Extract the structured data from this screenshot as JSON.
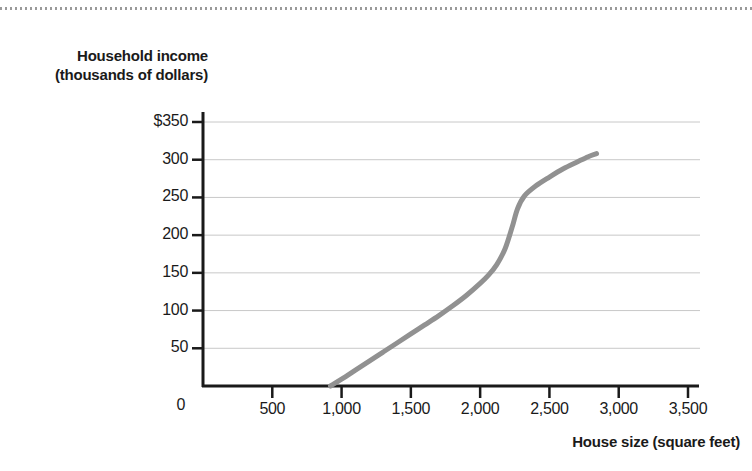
{
  "chart_data": {
    "type": "line",
    "title": "",
    "xlabel": "House size (square feet)",
    "ylabel": "Household income (thousands of dollars)",
    "xlim": [
      0,
      3500
    ],
    "ylim": [
      0,
      350
    ],
    "xticks": [
      0,
      500,
      1000,
      1500,
      2000,
      2500,
      3000,
      3500
    ],
    "xtick_labels": [
      "0",
      "500",
      "1,000",
      "1,500",
      "2,000",
      "2,500",
      "3,000",
      "3,500"
    ],
    "yticks": [
      0,
      50,
      100,
      150,
      200,
      250,
      300,
      350
    ],
    "ytick_labels": [
      "0",
      "50",
      "100",
      "150",
      "200",
      "250",
      "300",
      "$350"
    ],
    "grid": "horizontal",
    "legend": "none",
    "series": [
      {
        "name": "Household income vs house size",
        "color": "#919191",
        "linewidth": 5,
        "x": [
          920,
          1000,
          1100,
          1200,
          1300,
          1400,
          1500,
          1600,
          1700,
          1800,
          1900,
          2000,
          2060,
          2120,
          2180,
          2230,
          2270,
          2320,
          2400,
          2500,
          2600,
          2700,
          2780,
          2840
        ],
        "y": [
          0,
          9,
          21,
          33,
          45,
          57,
          69,
          81,
          93,
          106,
          120,
          136,
          147,
          161,
          182,
          210,
          235,
          252,
          265,
          277,
          288,
          297,
          304,
          308
        ]
      }
    ]
  },
  "axis": {
    "y_title_line1": "Household income",
    "y_title_line2": "(thousands of dollars)",
    "x_title": "House size (square feet)",
    "origin_label": "0"
  },
  "colors": {
    "curve": "#919191",
    "axis": "#1a1a1a",
    "grid": "#c8c8c8",
    "text": "#1a1a1a",
    "top_rule": "#9a9a9a"
  }
}
